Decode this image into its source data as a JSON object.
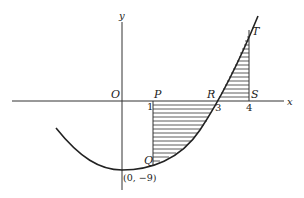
{
  "diagram": {
    "type": "graph",
    "curve": "y = x^2 - 9",
    "axes": {
      "x_label": "x",
      "y_label": "y",
      "origin_label": "O"
    },
    "points": {
      "P": "P",
      "R": "R",
      "S": "S",
      "T": "T",
      "Q": "Q",
      "vertex": "(0, −9)"
    },
    "ticks": {
      "one": "1",
      "three": "3",
      "four": "4"
    },
    "shaded_regions": [
      {
        "from_x": 1,
        "to_x": 3,
        "between": "curve and x-axis (below)"
      },
      {
        "from_x": 3,
        "to_x": 4,
        "between": "curve and x-axis (above)"
      }
    ],
    "colors": {
      "line": "#222222",
      "background": "#ffffff"
    }
  }
}
